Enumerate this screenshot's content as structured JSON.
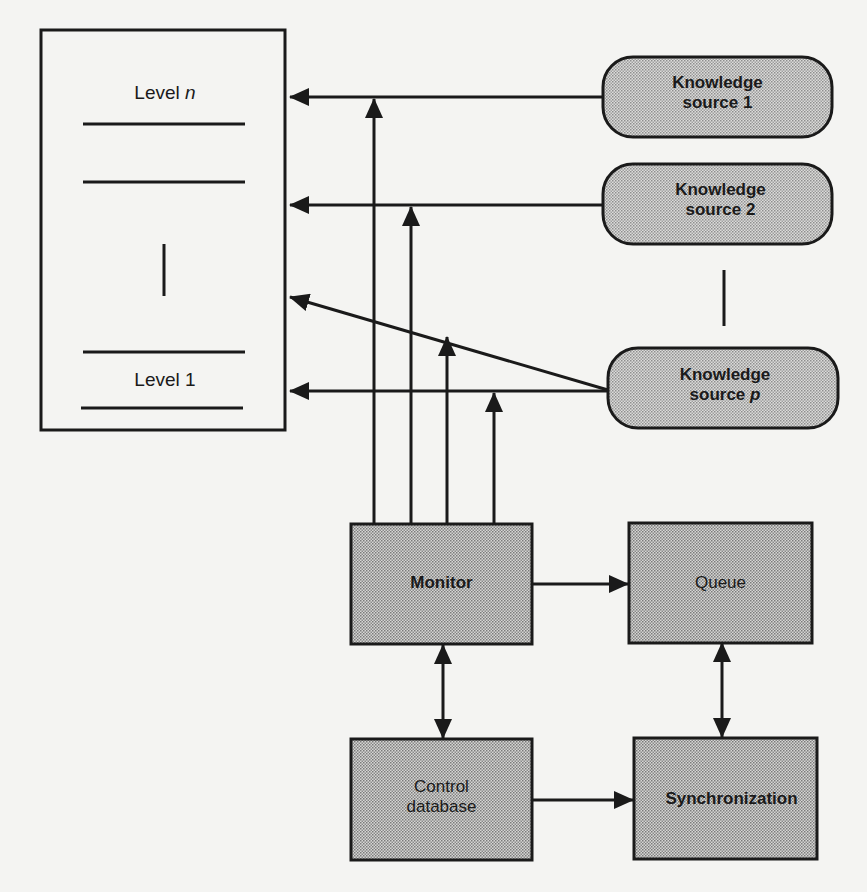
{
  "blackboard": {
    "levels": [
      {
        "prefix": "Level ",
        "suffix": "n"
      },
      {
        "prefix": "Level 1",
        "suffix": ""
      }
    ]
  },
  "knowledge_sources": [
    {
      "line1": "Knowledge",
      "line2_prefix": "source ",
      "line2_suffix": "1",
      "italic": false
    },
    {
      "line1": "Knowledge",
      "line2_prefix": "source ",
      "line2_suffix": "2",
      "italic": false
    },
    {
      "line1": "Knowledge",
      "line2_prefix": "source ",
      "line2_suffix": "p",
      "italic": true
    }
  ],
  "control": {
    "monitor": "Monitor",
    "queue": "Queue",
    "control_db_line1": "Control",
    "control_db_line2": "database",
    "synchronization": "Synchronization"
  },
  "colors": {
    "background": "#f4f4f2",
    "stroke": "#1a1a1a",
    "box_fill": "#b8b8b8",
    "rounded_fill": "#c8c8c8"
  }
}
